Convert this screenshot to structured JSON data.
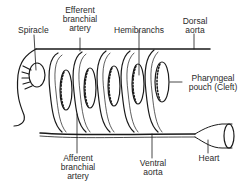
{
  "diagram": {
    "labels": {
      "spiracle": "Spiracle",
      "efferent_line1": "Efferent",
      "efferent_line2": "branchial",
      "efferent_line3": "artery",
      "hemibranchs": "Hemibranchs",
      "dorsal_line1": "Dorsal",
      "dorsal_line2": "aorta",
      "pharyngeal_line1": "Pharyngeal",
      "pharyngeal_line2": "pouch (Cleft)",
      "afferent_line1": "Afferent",
      "afferent_line2": "branchial",
      "afferent_line3": "artery",
      "ventral_line1": "Ventral",
      "ventral_line2": "aorta",
      "heart": "Heart"
    },
    "colors": {
      "line": "#1a1a1a",
      "background": "#ffffff"
    }
  }
}
